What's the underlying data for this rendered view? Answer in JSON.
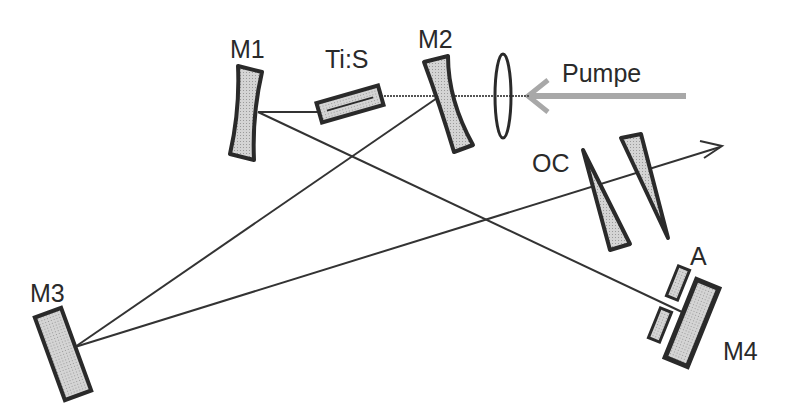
{
  "diagram": {
    "type": "laser-cavity-schematic",
    "labels": {
      "m1": "M1",
      "m2": "M2",
      "m3": "M3",
      "m4": "M4",
      "crystal": "Ti:S",
      "pump": "Pumpe",
      "output_coupler": "OC",
      "aperture": "A"
    },
    "colors": {
      "outline": "#2a2a2a",
      "fill": "#c8c8c8",
      "pump_beam": "#a8a8a8",
      "beam": "#333333"
    }
  }
}
